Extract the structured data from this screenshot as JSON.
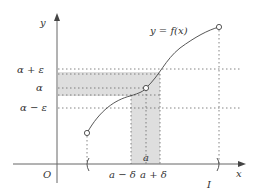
{
  "diagram": {
    "axes": {
      "x_label": "x",
      "y_label": "y",
      "origin_label": "O"
    },
    "curve_label": "y = f(x)",
    "y_ticks": [
      {
        "label": "α + ε",
        "y": 70
      },
      {
        "label": "α",
        "y": 88
      },
      {
        "label": "α − ε",
        "y": 107
      }
    ],
    "x_ticks": [
      {
        "label": "a − δ",
        "x": 131
      },
      {
        "label": "a",
        "x": 146
      },
      {
        "label": "a + δ",
        "x": 160
      }
    ],
    "interval_label": "I",
    "interval_brackets": [
      "(",
      ")"
    ],
    "colors": {
      "axis": "#555555",
      "curve": "#444444",
      "shade": "#dcdcdc",
      "dotted": "#666666",
      "text": "#333333"
    }
  }
}
